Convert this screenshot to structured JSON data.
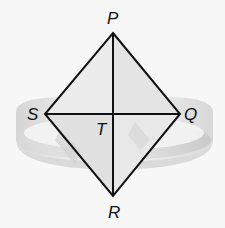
{
  "diagram": {
    "type": "geometric-figure",
    "vertices": {
      "P": {
        "label": "P",
        "x": 113,
        "y": 33
      },
      "Q": {
        "label": "Q",
        "x": 180,
        "y": 114
      },
      "R": {
        "label": "R",
        "x": 113,
        "y": 196
      },
      "S": {
        "label": "S",
        "x": 45,
        "y": 114
      },
      "T": {
        "label": "T",
        "x": 113,
        "y": 114
      }
    },
    "labels": {
      "P": "P",
      "Q": "Q",
      "R": "R",
      "S": "S",
      "T": "T"
    },
    "segments": [
      "PQ",
      "QR",
      "RS",
      "SP",
      "PR",
      "SQ"
    ],
    "colors": {
      "line": "#111111",
      "background": "#f7f7f7",
      "ring_light": "#e2e2e2",
      "ring_dark": "#c4c4c4",
      "face_light": "#ececec",
      "face_mid": "#dcdcdc"
    }
  }
}
